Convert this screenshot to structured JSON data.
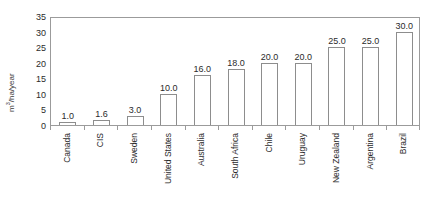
{
  "clipped_header_text": "",
  "chart_data": {
    "type": "bar",
    "title": "",
    "subtitle": "",
    "xlabel": "",
    "ylabel": "m3/ha/year",
    "ylabel_base": "m",
    "ylabel_exponent": "3",
    "ylabel_suffix": "/ha/year",
    "ylim": [
      0,
      35
    ],
    "yticks": [
      0,
      5,
      10,
      15,
      20,
      25,
      30,
      35
    ],
    "ytick_labels": [
      "0",
      "5",
      "10",
      "15",
      "20",
      "25",
      "30",
      "35"
    ],
    "grid": false,
    "legend": false,
    "legend_position": "none",
    "bar_fill_color": "#ffffff",
    "bar_edge_color": "#8d8d8d",
    "axis_color": "#9b9b9b",
    "text_color": "#2b2b2b",
    "categories": [
      "Canada",
      "CIS",
      "Sweden",
      "United States",
      "Australia",
      "South Africa",
      "Chile",
      "Uruguay",
      "New Zealand",
      "Argentina",
      "Brazil"
    ],
    "values": [
      1.0,
      1.6,
      3.0,
      10.0,
      16.0,
      18.0,
      20.0,
      20.0,
      25.0,
      25.0,
      30.0
    ],
    "value_labels": [
      "1.0",
      "1.6",
      "3.0",
      "10.0",
      "16.0",
      "18.0",
      "20.0",
      "20.0",
      "25.0",
      "25.0",
      "30.0"
    ]
  }
}
